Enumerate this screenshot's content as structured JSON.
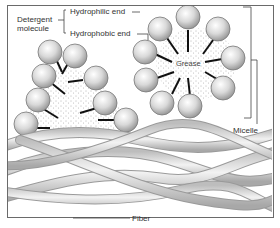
{
  "labels": {
    "detergent_molecule_line1": "Detergent",
    "detergent_molecule_line2": "molecule",
    "hydrophilic_end": "Hydrophilic end",
    "hydrophobic_end": "Hydrophobic end",
    "grease": "Grease",
    "micelle": "Micelle",
    "fiber": "Fiber"
  },
  "colors": {
    "frame": "#6a6a6a",
    "sphere_fill": "#d8d8d8",
    "sphere_stroke": "#777777",
    "tail": "#111111",
    "fiber": "#cfcfcf",
    "stipple": "#555555"
  }
}
